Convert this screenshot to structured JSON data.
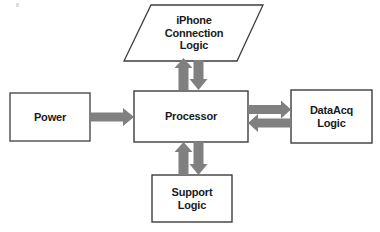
{
  "diagram": {
    "background_color": "#ffffff",
    "box_stroke_color": "#3d3d3d",
    "box_fill_color": "#ffffff",
    "arrow_color": "#808080",
    "text_color": "#1a1a1a",
    "nodes": [
      {
        "id": "iphone-connection-logic",
        "label": "iPhone\nConnection\nLogic",
        "shape": "parallelogram"
      },
      {
        "id": "power",
        "label": "Power",
        "shape": "rectangle"
      },
      {
        "id": "processor",
        "label": "Processor",
        "shape": "rectangle"
      },
      {
        "id": "dataacq-logic",
        "label": "DataAcq\nLogic",
        "shape": "rectangle"
      },
      {
        "id": "support-logic",
        "label": "Support\nLogic",
        "shape": "rectangle"
      }
    ],
    "connections": [
      {
        "id": "power-to-processor",
        "from": "power",
        "to": "processor",
        "direction": "right"
      },
      {
        "id": "processor-to-iphone",
        "from": "processor",
        "to": "iphone-connection-logic",
        "direction": "down"
      },
      {
        "id": "iphone-to-processor",
        "from": "iphone-connection-logic",
        "to": "processor",
        "direction": "up"
      },
      {
        "id": "processor-to-dataacq",
        "from": "processor",
        "to": "dataacq-logic",
        "direction": "right"
      },
      {
        "id": "dataacq-to-processor",
        "from": "dataacq-logic",
        "to": "processor",
        "direction": "left"
      },
      {
        "id": "processor-to-support",
        "from": "processor",
        "to": "support-logic",
        "direction": "down"
      },
      {
        "id": "support-to-processor",
        "from": "support-logic",
        "to": "processor",
        "direction": "up"
      }
    ]
  }
}
